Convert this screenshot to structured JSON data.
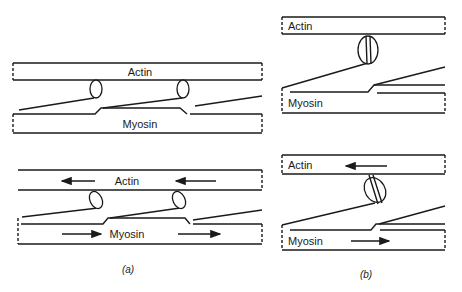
{
  "figure": {
    "panel_a": {
      "caption": "(a)",
      "top": {
        "actin_label": "Actin",
        "myosin_label": "Myosin"
      },
      "bottom": {
        "actin_label": "Actin",
        "myosin_label": "Myosin",
        "actin_arrow_direction": "left",
        "myosin_arrow_direction": "right"
      }
    },
    "panel_b": {
      "caption": "(b)",
      "top": {
        "actin_label": "Actin",
        "myosin_label": "Myosin"
      },
      "bottom": {
        "actin_label": "Actin",
        "myosin_label": "Myosin",
        "actin_arrow_direction": "left",
        "myosin_arrow_direction": "right"
      }
    }
  }
}
